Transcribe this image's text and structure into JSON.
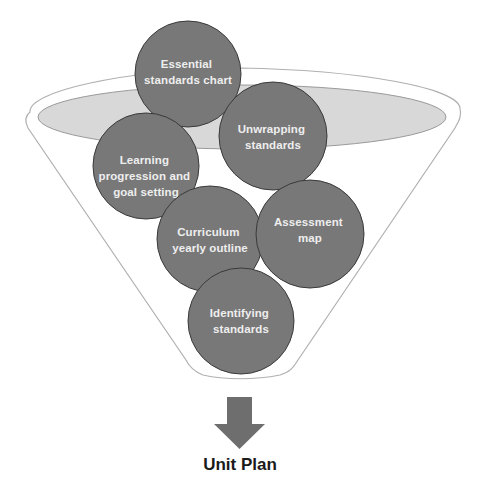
{
  "diagram": {
    "type": "funnel",
    "colors": {
      "funnel_outline": "#b0b0b0",
      "funnel_fill": "#ffffff",
      "rim_ellipse_fill": "#d6d6d6",
      "rim_ellipse_stroke": "#9a9a9a",
      "circle_fill": "#777777",
      "circle_stroke": "#3a3a3a",
      "circle_text": "#eeeeee",
      "arrow_fill": "#6e6e6e",
      "output_text": "#1a1a1a"
    },
    "inputs": [
      {
        "id": "essential-standards-chart",
        "lines": [
          "Essential",
          "standards chart"
        ]
      },
      {
        "id": "unwrapping-standards",
        "lines": [
          "Unwrapping",
          "standards"
        ]
      },
      {
        "id": "learning-progression",
        "lines": [
          "Learning",
          "progression and",
          "goal setting"
        ]
      },
      {
        "id": "curriculum-yearly-outline",
        "lines": [
          "Curriculum",
          "yearly outline"
        ]
      },
      {
        "id": "assessment-map",
        "lines": [
          "Assessment",
          "map"
        ]
      },
      {
        "id": "identifying-standards",
        "lines": [
          "Identifying",
          "standards"
        ]
      }
    ],
    "arrow": {
      "direction": "down",
      "icon": "down-arrow-icon"
    },
    "output": {
      "label": "Unit Plan"
    }
  }
}
